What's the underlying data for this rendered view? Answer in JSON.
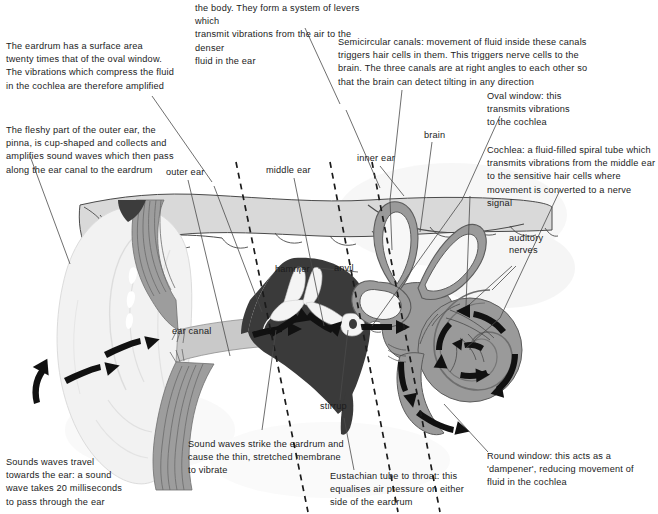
{
  "figure": {
    "colors": {
      "text": "#1b1b1b",
      "leader_line": "#4a4a4a",
      "pinna_fill": "#f2f2f2",
      "pinna_stroke": "#d8d8d8",
      "skull_fill": "#d9d9d9",
      "skull_stroke": "#4a4a4a",
      "canal_fill": "#c9c9c9",
      "canal_wall": "#8f8f8f",
      "middle_ear_fill": "#3a3a3a",
      "ossicle_fill": "#f4f4f4",
      "inner_ear_fill": "#9a9a9a",
      "inner_ear_stroke": "#5c5c5c",
      "arrow_fill": "#111111"
    }
  },
  "annotations": [
    {
      "id": "ossicles-note",
      "text": "the body. They form a system of levers which\ntransmit vibrations from the air to the denser\nfluid in the ear"
    },
    {
      "id": "eardrum-area-note",
      "text": "The eardrum has a surface area\ntwenty times that of the oval window.\nThe vibrations which compress the fluid\nin the cochlea are therefore amplified"
    },
    {
      "id": "pinna-note",
      "text": "The fleshy part of the outer ear, the\npinna, is cup-shaped and collects and\namplifies sound waves which then pass\nalong the ear canal to the eardrum"
    },
    {
      "id": "semicircular-canals-note",
      "text": "Semicircular canals: movement of fluid inside these canals\ntriggers hair cells in them. This triggers nerve cells to the\nbrain. The three canals are at right angles to each other so\nthat the brain can detect tilting in any direction"
    },
    {
      "id": "oval-window-note",
      "text": "Oval window: this\ntransmits vibrations\nto the cochlea"
    },
    {
      "id": "cochlea-note",
      "text": "Cochlea: a fluid-filled spiral tube which\ntransmits vibrations from the middle ear\nto the sensitive hair cells where\nmovement is converted to a nerve signal"
    },
    {
      "id": "sound-waves-travel-note",
      "text": "Sounds waves travel\ntowards the ear: a sound\nwave takes 20 milliseconds\nto pass through the ear"
    },
    {
      "id": "eardrum-strike-note",
      "text": "Sound waves strike the eardrum and\ncause the thin, stretched membrane\nto vibrate"
    },
    {
      "id": "eustachian-tube-note",
      "text": "Eustachian tube to throat: this\nequalises air pressure on either\nside of the eardrum"
    },
    {
      "id": "round-window-note",
      "text": "Round window: this acts as a\n'dampener', reducing movement of\nfluid in the cochlea"
    }
  ],
  "part_labels": [
    {
      "id": "outer-ear",
      "text": "outer ear"
    },
    {
      "id": "middle-ear",
      "text": "middle ear"
    },
    {
      "id": "inner-ear",
      "text": "inner ear"
    },
    {
      "id": "brain",
      "text": "brain"
    },
    {
      "id": "auditory-nerves",
      "text": "auditory\nnerves"
    },
    {
      "id": "hammer",
      "text": "hammer"
    },
    {
      "id": "anvil",
      "text": "anvil"
    },
    {
      "id": "stirrup",
      "text": "stirrup"
    },
    {
      "id": "ear-canal",
      "text": "ear canal"
    }
  ]
}
